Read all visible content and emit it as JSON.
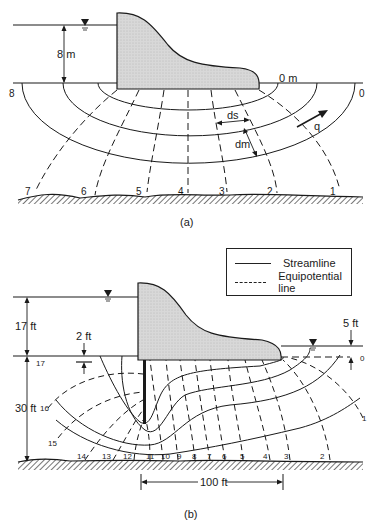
{
  "figure_a": {
    "caption": "(a)",
    "upstream_head_label": "8 m",
    "downstream_head_label": "0 m",
    "ds_label": "ds",
    "dm_label": "dm",
    "q_label": "q",
    "left_end_label": "8",
    "right_end_label": "0",
    "equipotential_labels": [
      "7",
      "6",
      "5",
      "4",
      "3",
      "2",
      "1"
    ]
  },
  "figure_b": {
    "caption": "(b)",
    "legend": {
      "items": [
        {
          "label": "Streamline",
          "style": "solid"
        },
        {
          "label": "Equipotential line",
          "style": "dashed"
        }
      ]
    },
    "upstream_head_label": "17 ft",
    "depth_label": "30 ft",
    "cutoff_label": "2 ft",
    "tailwater_label": "5 ft",
    "base_length_label": "100 ft",
    "left_level_label": "17",
    "right_level_label": "0",
    "equipotential_labels": [
      "16",
      "15",
      "14",
      "13",
      "12",
      "11",
      "10",
      "9",
      "8",
      "7",
      "6",
      "5",
      "4",
      "3",
      "2",
      "1"
    ]
  },
  "colors": {
    "dam_fill": "#d4d4d4",
    "line": "#1a1a1a"
  }
}
